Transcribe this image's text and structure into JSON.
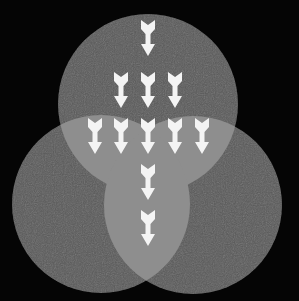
{
  "diagram": {
    "type": "venn-three-circles",
    "background": "#050505",
    "circle_fill": "#5a5a5a",
    "overlap_fill": "#8e8e8e",
    "arrow_color": "#f4f4f4",
    "circles": [
      {
        "name": "top",
        "cx": 148,
        "cy": 104,
        "r": 90
      },
      {
        "name": "left",
        "cx": 101,
        "cy": 204,
        "r": 89
      },
      {
        "name": "right",
        "cx": 193,
        "cy": 205,
        "r": 89
      }
    ],
    "arrow_rows": [
      {
        "y": 20,
        "xs": [
          148
        ]
      },
      {
        "y": 72,
        "xs": [
          121,
          148,
          175
        ]
      },
      {
        "y": 118,
        "xs": [
          95,
          121,
          148,
          175,
          202
        ]
      },
      {
        "y": 164,
        "xs": [
          148
        ]
      },
      {
        "y": 210,
        "xs": [
          148
        ]
      }
    ],
    "arrow_direction": "down"
  }
}
